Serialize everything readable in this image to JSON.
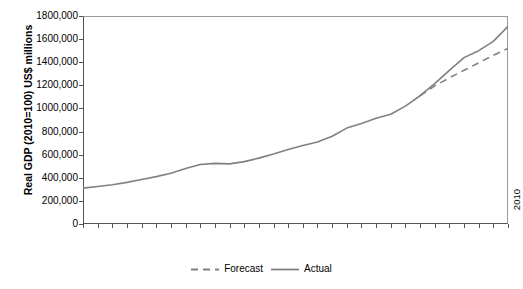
{
  "chart_data": {
    "type": "line",
    "title": "",
    "xlabel": "",
    "ylabel": "Real GDP (2010=100) US$ millions",
    "ylim": [
      0,
      1800000
    ],
    "ytick_labels": [
      "1800,000",
      "1600,000",
      "1400,000",
      "1200,000",
      "1000,000",
      "800,000",
      "600,000",
      "400,000",
      "200,000",
      "0"
    ],
    "ytick_values": [
      1800000,
      1600000,
      1400000,
      1200000,
      1000000,
      800000,
      600000,
      400000,
      200000,
      0
    ],
    "grid": false,
    "legend_position": "bottom-center",
    "x": [
      1981,
      1982,
      1983,
      1984,
      1985,
      1986,
      1987,
      1988,
      1989,
      1990,
      1991,
      1992,
      1993,
      1994,
      1995,
      1996,
      1997,
      1998,
      1999,
      2000,
      2001,
      2002,
      2003,
      2004,
      2005,
      2006,
      2007,
      2008,
      2009,
      2010
    ],
    "categories": [
      "1981",
      "1982",
      "1983",
      "1984",
      "1985",
      "1986",
      "1987",
      "1988",
      "1989",
      "1990",
      "1991",
      "1992",
      "1993",
      "1994",
      "1995",
      "1996",
      "1997",
      "1998",
      "1999",
      "2000",
      "2001",
      "2002",
      "2003",
      "2004",
      "2005",
      "2006",
      "2007",
      "2008",
      "2009",
      "2010"
    ],
    "series": [
      {
        "name": "Actual",
        "style": "solid",
        "color": "#808080",
        "x": [
          1981,
          1982,
          1983,
          1984,
          1985,
          1986,
          1987,
          1988,
          1989,
          1990,
          1991,
          1992,
          1993,
          1994,
          1995,
          1996,
          1997,
          1998,
          1999,
          2000,
          2001,
          2002,
          2003,
          2004,
          2005,
          2006,
          2007,
          2008,
          2009,
          2010
        ],
        "values": [
          310000,
          325000,
          340000,
          360000,
          385000,
          410000,
          440000,
          480000,
          515000,
          525000,
          520000,
          540000,
          570000,
          605000,
          645000,
          680000,
          710000,
          760000,
          830000,
          870000,
          915000,
          950000,
          1020000,
          1110000,
          1215000,
          1330000,
          1440000,
          1500000,
          1580000,
          1710000
        ]
      },
      {
        "name": "Forecast",
        "style": "dashed",
        "color": "#808080",
        "x": [
          2004,
          2005,
          2006,
          2007,
          2008,
          2009,
          2010
        ],
        "values": [
          1110000,
          1195000,
          1265000,
          1330000,
          1395000,
          1460000,
          1520000
        ]
      }
    ]
  },
  "legend": {
    "items": [
      {
        "label": "Forecast",
        "style": "dashed"
      },
      {
        "label": "Actual",
        "style": "solid"
      }
    ]
  }
}
